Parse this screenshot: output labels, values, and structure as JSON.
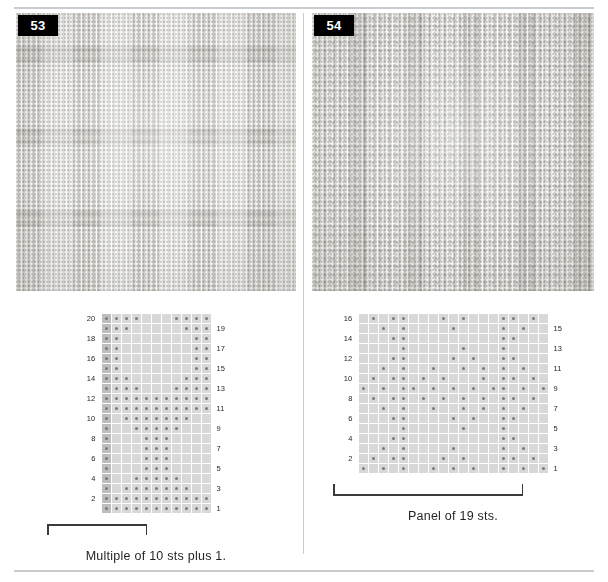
{
  "page": {
    "background_color": "#ffffff",
    "rule_color": "#c9ccce",
    "divider_color": "#c9ccce"
  },
  "panels": [
    {
      "id": "panel-53",
      "badge": "53",
      "swatch_alt": "Knitted swatch 53 — basketweave blocks of stockinette and reverse stockinette",
      "caption": "Multiple of 10 sts plus 1.",
      "chart": {
        "columns": 11,
        "rows": 20,
        "cell_size": 9,
        "dot_color": "#7a7a7a",
        "cell_color": "#d8d8d8",
        "edge_column_color": "#bdbdbd",
        "left_labels": [
          "20",
          "18",
          "16",
          "14",
          "12",
          "10",
          "8",
          "6",
          "4",
          "2"
        ],
        "right_labels": [
          "19",
          "17",
          "15",
          "13",
          "11",
          "9",
          "7",
          "5",
          "3",
          "1"
        ],
        "repeat_bracket": {
          "start_col": 2,
          "end_col": 11
        }
      }
    },
    {
      "id": "panel-54",
      "badge": "54",
      "swatch_alt": "Knitted swatch 54 — vertical ribbed panel with traveling seed stitch chevrons",
      "caption": "Panel of 19 sts.",
      "chart": {
        "columns": 19,
        "rows": 16,
        "cell_size": 9,
        "dot_color": "#7a7a7a",
        "cell_color": "#d8d8d8",
        "left_labels": [
          "16",
          "14",
          "12",
          "10",
          "8",
          "6",
          "4",
          "2"
        ],
        "right_labels": [
          "15",
          "13",
          "11",
          "9",
          "7",
          "5",
          "3",
          "1"
        ],
        "measure_line": {
          "start_col": 1,
          "end_col": 19
        }
      }
    }
  ],
  "chart_data": [
    {
      "type": "heatmap",
      "title": "Chart 53",
      "subtitle": "Multiple of 10 sts plus 1.",
      "xlabel": "stitches (read right to left on odd rows)",
      "ylabel": "rows",
      "columns": 11,
      "rows": 16,
      "row_labels_left": [
        "20",
        "18",
        "16",
        "14",
        "12",
        "10",
        "8",
        "6",
        "4",
        "2"
      ],
      "row_labels_right": [
        "19",
        "17",
        "15",
        "13",
        "11",
        "9",
        "7",
        "5",
        "3",
        "1"
      ],
      "legend": [
        {
          "symbol": "dot",
          "meaning": "purl on RS, knit on WS"
        },
        {
          "symbol": "blank",
          "meaning": "knit on RS, purl on WS"
        }
      ],
      "grid": [
        [
          1,
          1,
          1,
          1,
          0,
          0,
          0,
          1,
          1,
          1,
          1
        ],
        [
          1,
          1,
          1,
          0,
          0,
          0,
          0,
          0,
          1,
          1,
          1
        ],
        [
          1,
          1,
          0,
          0,
          0,
          0,
          0,
          0,
          0,
          1,
          1
        ],
        [
          1,
          1,
          0,
          0,
          0,
          0,
          0,
          0,
          0,
          1,
          1
        ],
        [
          1,
          1,
          0,
          0,
          0,
          0,
          0,
          0,
          0,
          1,
          1
        ],
        [
          1,
          1,
          0,
          0,
          0,
          0,
          0,
          0,
          0,
          1,
          1
        ],
        [
          1,
          1,
          1,
          0,
          0,
          0,
          0,
          0,
          1,
          1,
          1
        ],
        [
          1,
          1,
          1,
          1,
          0,
          0,
          0,
          1,
          1,
          1,
          1
        ],
        [
          1,
          1,
          1,
          1,
          1,
          1,
          1,
          1,
          1,
          1,
          1
        ],
        [
          1,
          1,
          1,
          1,
          1,
          1,
          1,
          1,
          1,
          1,
          1
        ],
        [
          1,
          0,
          1,
          1,
          1,
          1,
          1,
          1,
          1,
          0,
          0
        ],
        [
          1,
          0,
          0,
          1,
          1,
          1,
          1,
          1,
          0,
          0,
          0
        ],
        [
          1,
          0,
          0,
          0,
          1,
          1,
          1,
          0,
          0,
          0,
          0
        ],
        [
          1,
          0,
          0,
          0,
          1,
          1,
          1,
          0,
          0,
          0,
          0
        ],
        [
          1,
          0,
          0,
          0,
          1,
          1,
          1,
          0,
          0,
          0,
          0
        ],
        [
          1,
          0,
          0,
          0,
          1,
          1,
          1,
          0,
          0,
          0,
          0
        ],
        [
          1,
          0,
          0,
          1,
          1,
          1,
          1,
          1,
          0,
          0,
          0
        ],
        [
          1,
          0,
          1,
          1,
          1,
          1,
          1,
          1,
          1,
          0,
          0
        ],
        [
          1,
          1,
          1,
          1,
          1,
          1,
          1,
          1,
          1,
          1,
          1
        ],
        [
          1,
          1,
          1,
          1,
          1,
          1,
          1,
          1,
          1,
          1,
          1
        ]
      ],
      "note": "grid rows listed top (row 20) to bottom (row 1); 1 = dot cell, 0 = blank cell"
    },
    {
      "type": "heatmap",
      "title": "Chart 54",
      "subtitle": "Panel of 19 sts.",
      "xlabel": "stitches (read right to left on odd rows)",
      "ylabel": "rows",
      "columns": 19,
      "rows": 16,
      "row_labels_left": [
        "16",
        "14",
        "12",
        "10",
        "8",
        "6",
        "4",
        "2"
      ],
      "row_labels_right": [
        "15",
        "13",
        "11",
        "9",
        "7",
        "5",
        "3",
        "1"
      ],
      "legend": [
        {
          "symbol": "dot",
          "meaning": "purl on RS, knit on WS"
        },
        {
          "symbol": "blank",
          "meaning": "knit on RS, purl on WS"
        }
      ],
      "grid": [
        [
          0,
          1,
          0,
          1,
          1,
          0,
          0,
          0,
          1,
          0,
          1,
          0,
          0,
          0,
          1,
          1,
          0,
          1,
          0
        ],
        [
          0,
          0,
          1,
          0,
          1,
          0,
          0,
          0,
          0,
          1,
          0,
          0,
          0,
          0,
          1,
          0,
          1,
          0,
          0
        ],
        [
          0,
          0,
          0,
          1,
          1,
          0,
          0,
          0,
          0,
          0,
          0,
          0,
          0,
          0,
          1,
          1,
          0,
          0,
          0
        ],
        [
          0,
          0,
          0,
          0,
          1,
          0,
          0,
          0,
          0,
          0,
          1,
          0,
          0,
          0,
          1,
          0,
          0,
          0,
          0
        ],
        [
          0,
          0,
          0,
          1,
          1,
          0,
          0,
          0,
          0,
          1,
          0,
          1,
          0,
          0,
          1,
          1,
          0,
          0,
          0
        ],
        [
          0,
          0,
          1,
          0,
          1,
          0,
          0,
          1,
          0,
          0,
          1,
          0,
          1,
          0,
          1,
          0,
          1,
          0,
          0
        ],
        [
          0,
          1,
          0,
          1,
          1,
          0,
          1,
          0,
          1,
          0,
          0,
          0,
          1,
          0,
          1,
          1,
          0,
          1,
          0
        ],
        [
          1,
          0,
          1,
          0,
          1,
          1,
          0,
          1,
          0,
          1,
          0,
          1,
          0,
          1,
          1,
          0,
          1,
          0,
          1
        ],
        [
          0,
          1,
          0,
          1,
          1,
          0,
          1,
          0,
          1,
          0,
          1,
          0,
          1,
          0,
          1,
          1,
          0,
          1,
          0
        ],
        [
          0,
          0,
          1,
          0,
          1,
          0,
          0,
          1,
          0,
          0,
          1,
          0,
          1,
          0,
          1,
          0,
          1,
          0,
          0
        ],
        [
          0,
          0,
          0,
          1,
          1,
          0,
          0,
          0,
          0,
          1,
          0,
          1,
          0,
          0,
          1,
          1,
          0,
          0,
          0
        ],
        [
          0,
          0,
          0,
          0,
          1,
          0,
          0,
          0,
          0,
          0,
          1,
          0,
          0,
          0,
          1,
          0,
          0,
          0,
          0
        ],
        [
          0,
          0,
          0,
          1,
          1,
          0,
          0,
          0,
          0,
          0,
          0,
          0,
          0,
          0,
          1,
          1,
          0,
          0,
          0
        ],
        [
          0,
          0,
          1,
          0,
          1,
          0,
          0,
          0,
          0,
          1,
          0,
          0,
          0,
          0,
          1,
          0,
          1,
          0,
          0
        ],
        [
          0,
          1,
          0,
          1,
          1,
          0,
          0,
          0,
          1,
          0,
          1,
          0,
          0,
          0,
          1,
          1,
          0,
          1,
          0
        ],
        [
          1,
          0,
          1,
          0,
          1,
          0,
          0,
          1,
          0,
          1,
          0,
          1,
          0,
          0,
          1,
          0,
          1,
          0,
          1
        ]
      ],
      "note": "grid rows listed top (row 16) to bottom (row 1); 1 = dot cell, 0 = blank cell"
    }
  ]
}
